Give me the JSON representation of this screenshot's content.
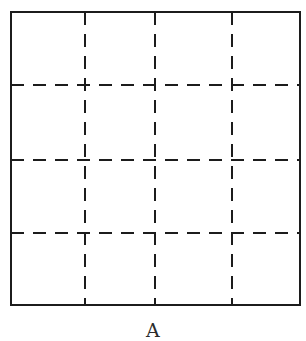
{
  "figure": {
    "kind": "grid-diagram",
    "caption": "A",
    "caption_x": 184,
    "caption_y": 321,
    "background_color": "#ffffff",
    "line_color": "#1c1c1c",
    "border": {
      "label": "outer-rectangle",
      "x": 11,
      "y": 12,
      "width": 289,
      "height": 293,
      "stroke_width": 2,
      "style": "solid"
    },
    "dash_pattern": {
      "dash": 13,
      "gap": 9,
      "stroke_width": 1.8
    },
    "vertical_lines": [
      {
        "label": "vertical-divider-1",
        "x": 85
      },
      {
        "label": "vertical-divider-2",
        "x": 155
      },
      {
        "label": "vertical-divider-3",
        "x": 232
      }
    ],
    "horizontal_lines": [
      {
        "label": "horizontal-divider-1",
        "y": 85
      },
      {
        "label": "horizontal-divider-2",
        "y": 160
      },
      {
        "label": "horizontal-divider-3",
        "y": 233
      }
    ],
    "grid": {
      "columns": 4,
      "rows": 4,
      "cells": 16
    }
  }
}
